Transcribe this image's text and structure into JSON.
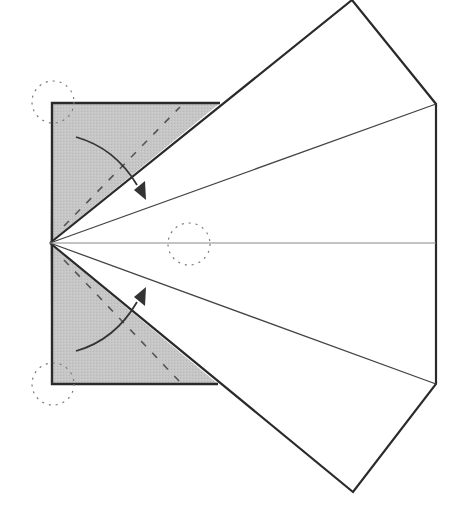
{
  "diagram": {
    "colors": {
      "paper_back": "#c4c4c4",
      "paper_front": "#ffffff",
      "edge": "#2a2a2a",
      "crease": "#555555",
      "circle": "#777777",
      "arrow": "#333333"
    },
    "elements": {
      "gray_square": "Gray (colored side) square at left",
      "white_kite": "White flaps fanning to the right",
      "valley_folds": 2,
      "fold_arrows": 2,
      "reference_circles": 3
    }
  }
}
